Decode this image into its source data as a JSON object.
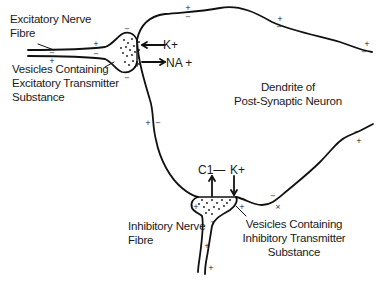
{
  "diagram": {
    "labels": {
      "excitatory_fibre_line1": "Excitatory Nerve",
      "excitatory_fibre_line2": "Fibre",
      "excitatory_vesicles_line1": "Vesicles Containing",
      "excitatory_vesicles_line2": "Excitatory Transmitter",
      "excitatory_vesicles_line3": "Substance",
      "dendrite_line1": "Dendrite of",
      "dendrite_line2": "Post-Synaptic Neuron",
      "inhibitory_fibre_line1": "Inhibitory Nerve",
      "inhibitory_fibre_line2": "Fibre",
      "inhibitory_vesicles_line1": "Vesicles Containing",
      "inhibitory_vesicles_line2": "Inhibitory Transmitter",
      "inhibitory_vesicles_line3": "Substance"
    },
    "ions": {
      "excitatory_in": "K+",
      "excitatory_out": "NA +",
      "inhibitory_out": "C1—",
      "inhibitory_in": "K+"
    },
    "charges": {
      "plus": "+",
      "minus": "−"
    },
    "colors": {
      "stroke": "#111111",
      "background": "#ffffff"
    }
  }
}
